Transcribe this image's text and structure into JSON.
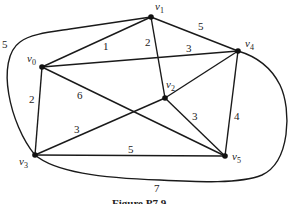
{
  "figure": {
    "caption": "Figure P7.9",
    "stroke_color": "#1a1a1a"
  },
  "vertices": [
    {
      "id": "v0",
      "name": "v",
      "sub": "0",
      "x": 42,
      "y": 67,
      "lx": 27,
      "ly": 58
    },
    {
      "id": "v1",
      "name": "v",
      "sub": "1",
      "x": 151,
      "y": 17,
      "lx": 155,
      "ly": 10
    },
    {
      "id": "v2",
      "name": "v",
      "sub": "2",
      "x": 165,
      "y": 98,
      "lx": 163,
      "ly": 86
    },
    {
      "id": "v3",
      "name": "v",
      "sub": "3",
      "x": 35,
      "y": 155,
      "lx": 19,
      "ly": 166
    },
    {
      "id": "v4",
      "name": "v",
      "sub": "4",
      "x": 238,
      "y": 51,
      "lx": 244,
      "ly": 47
    },
    {
      "id": "v5",
      "name": "v",
      "sub": "5",
      "x": 225,
      "y": 156,
      "lx": 232,
      "ly": 160
    }
  ],
  "edges": [
    {
      "from": "v0",
      "to": "v1",
      "weight": "1",
      "lx": 103,
      "ly": 50
    },
    {
      "from": "v1",
      "to": "v2",
      "weight": "2",
      "lx": 145,
      "ly": 46
    },
    {
      "from": "v1",
      "to": "v4",
      "weight": "5",
      "lx": 198,
      "ly": 30
    },
    {
      "from": "v0",
      "to": "v4",
      "weight": "3",
      "lx": 186,
      "ly": 52
    },
    {
      "from": "v2",
      "to": "v4",
      "weight": ""
    },
    {
      "from": "v0",
      "to": "v3",
      "weight": "2",
      "lx": 29,
      "ly": 103
    },
    {
      "from": "v0",
      "to": "v5",
      "weight": "6",
      "lx": 77,
      "ly": 99
    },
    {
      "from": "v3",
      "to": "v2",
      "weight": "3",
      "lx": 74,
      "ly": 133
    },
    {
      "from": "v2",
      "to": "v5",
      "weight": "3",
      "lx": 192,
      "ly": 120
    },
    {
      "from": "v4",
      "to": "v5",
      "weight": "4",
      "lx": 234,
      "ly": 120
    },
    {
      "from": "v3",
      "to": "v5",
      "weight": "5",
      "lx": 128,
      "ly": 153
    },
    {
      "from": "v3",
      "to": "v1",
      "weight": "5",
      "curved": true,
      "lx": 2,
      "ly": 48
    },
    {
      "from": "v3",
      "to": "v4",
      "weight": "7",
      "curved": true,
      "lx": 154,
      "ly": 192
    }
  ]
}
